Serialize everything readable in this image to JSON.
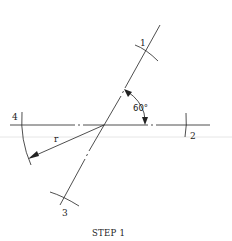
{
  "diagram": {
    "caption": "STEP 1",
    "angle_label": "60°",
    "radius_label": "r",
    "points": [
      {
        "id": "1",
        "label": "1"
      },
      {
        "id": "2",
        "label": "2"
      },
      {
        "id": "3",
        "label": "3"
      },
      {
        "id": "4",
        "label": "4"
      }
    ],
    "colors": {
      "line": "#222222",
      "faint_rule": "#e2e2e2",
      "background": "#ffffff"
    }
  }
}
